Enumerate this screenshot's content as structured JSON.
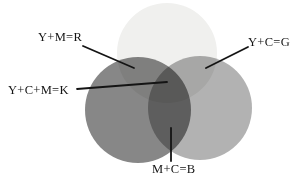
{
  "diagram": {
    "title_meaning": "Subtractive CMY color mixing venn diagram (grayscale print)",
    "labels": {
      "ym_r": "Y+M=R",
      "yc_g": "Y+C=G",
      "ycm_k": "Y+C+M=K",
      "mc_b": "M+C=B"
    },
    "colors": {
      "background": "#ffffff",
      "yellow_circle": "#f0f0ee",
      "magenta_circle": "#878787",
      "cyan_circle": "#b2b2b2",
      "text": "#141414",
      "line": "#141414"
    },
    "circles": [
      {
        "name": "yellow-circle",
        "position": "top",
        "color": "#f0f0ee"
      },
      {
        "name": "magenta-circle",
        "position": "bottom-left",
        "color": "#878787"
      },
      {
        "name": "cyan-circle",
        "position": "bottom-right",
        "color": "#b2b2b2"
      }
    ]
  }
}
